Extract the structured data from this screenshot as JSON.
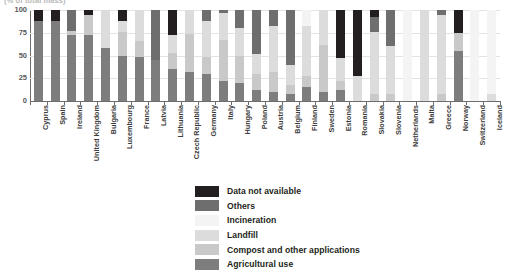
{
  "title_clipped": "(% of total mass)",
  "chart_data": {
    "type": "bar",
    "subtype": "stacked-bar-100",
    "title": "(% of total mass)",
    "xlabel": "",
    "ylabel": "",
    "ylim": [
      0,
      100
    ],
    "yticks": [
      0,
      25,
      50,
      75,
      100
    ],
    "grid": true,
    "legend_position": "bottom-center",
    "series": [
      {
        "name": "Agricultural use",
        "color": "#7d7d7d",
        "values": [
          88,
          88,
          72,
          72,
          58,
          50,
          48,
          45,
          35,
          32,
          30,
          22,
          20,
          12,
          10,
          8,
          15,
          10,
          12,
          0,
          0,
          0,
          0,
          0,
          0,
          55,
          0,
          0
        ]
      },
      {
        "name": "Compost and other applications",
        "color": "#c9c9c9",
        "values": [
          0,
          0,
          5,
          22,
          0,
          26,
          18,
          0,
          18,
          42,
          18,
          45,
          30,
          18,
          22,
          10,
          12,
          52,
          10,
          0,
          8,
          8,
          0,
          0,
          8,
          20,
          0,
          0
        ]
      },
      {
        "name": "Landfill",
        "color": "#dcdcdc",
        "values": [
          0,
          0,
          0,
          0,
          42,
          12,
          34,
          0,
          20,
          26,
          40,
          30,
          30,
          22,
          50,
          22,
          55,
          38,
          25,
          28,
          68,
          52,
          0,
          100,
          86,
          0,
          0,
          8
        ]
      },
      {
        "name": "Incineration",
        "color": "#f4f4f4",
        "values": [
          0,
          0,
          0,
          0,
          0,
          0,
          0,
          0,
          0,
          0,
          0,
          0,
          0,
          0,
          0,
          0,
          18,
          0,
          0,
          0,
          0,
          0,
          100,
          0,
          0,
          0,
          100,
          92
        ]
      },
      {
        "name": "Others",
        "color": "#6e6e6e",
        "values": [
          0,
          0,
          23,
          0,
          0,
          0,
          0,
          55,
          0,
          0,
          12,
          3,
          20,
          48,
          18,
          60,
          0,
          0,
          0,
          0,
          16,
          40,
          0,
          0,
          6,
          0,
          0,
          0
        ]
      },
      {
        "name": "Data not available",
        "color": "#231f20",
        "values": [
          12,
          12,
          0,
          6,
          0,
          12,
          0,
          0,
          27,
          0,
          0,
          0,
          0,
          0,
          0,
          0,
          0,
          0,
          53,
          72,
          8,
          0,
          0,
          0,
          0,
          25,
          0,
          0
        ]
      }
    ],
    "categories": [
      "Cyprus",
      "Spain",
      "Ireland",
      "United Kingdom",
      "Bulgaria",
      "Luxembourg",
      "France",
      "Latvia",
      "Lithuania",
      "Czech Republic",
      "Germany",
      "Italy",
      "Hungary",
      "Poland",
      "Austria",
      "Belgium",
      "Finland",
      "Sweden",
      "Estonia",
      "Romania",
      "Slovakia",
      "Slovenia",
      "Netherlands",
      "Malta",
      "Greece",
      "Norway",
      "Switzerland",
      "Iceland"
    ]
  },
  "legend": {
    "items": [
      {
        "label": "Data not available",
        "color": "#231f20"
      },
      {
        "label": "Others",
        "color": "#6e6e6e"
      },
      {
        "label": "Incineration",
        "color": "#f4f4f4"
      },
      {
        "label": "Landfill",
        "color": "#dcdcdc"
      },
      {
        "label": "Compost and other applications",
        "color": "#c9c9c9"
      },
      {
        "label": "Agricultural use",
        "color": "#7d7d7d"
      }
    ]
  }
}
